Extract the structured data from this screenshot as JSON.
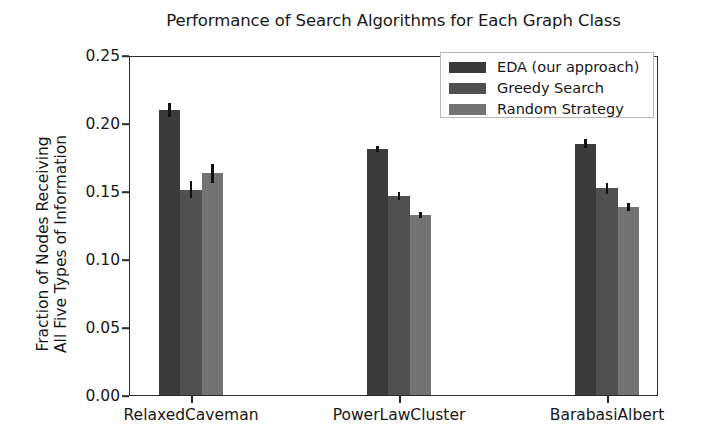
{
  "chart_data": {
    "type": "bar",
    "title": "Performance of Search Algorithms for Each Graph Class",
    "xlabel": "",
    "ylabel": "Fraction of Nodes Receiving All Five Types of Information",
    "ylabel_line1": "Fraction of Nodes Receiving",
    "ylabel_line2": "All Five Types of Information",
    "categories": [
      "RelaxedCaveman",
      "PowerLawCluster",
      "BarabasiAlbert"
    ],
    "ylim": [
      0.0,
      0.25
    ],
    "yticks": [
      "0.00",
      "0.05",
      "0.10",
      "0.15",
      "0.20",
      "0.25"
    ],
    "ytick_values": [
      0.0,
      0.05,
      0.1,
      0.15,
      0.2,
      0.25
    ],
    "grid": false,
    "legend_position": "upper right",
    "series": [
      {
        "name": "EDA (our approach)",
        "color": "#3b3b3b",
        "values": [
          0.211,
          0.182,
          0.186
        ],
        "errors": [
          0.005,
          0.002,
          0.003
        ]
      },
      {
        "name": "Greedy Search",
        "color": "#505050",
        "values": [
          0.152,
          0.147,
          0.153
        ],
        "errors": [
          0.006,
          0.003,
          0.004
        ]
      },
      {
        "name": "Random Strategy",
        "color": "#737373",
        "values": [
          0.164,
          0.133,
          0.139
        ],
        "errors": [
          0.007,
          0.002,
          0.003
        ]
      }
    ]
  },
  "axis": {
    "ytick_labels": [
      "0.25",
      "0.20",
      "0.15",
      "0.10",
      "0.05",
      "0.00"
    ],
    "xtick_labels": [
      "RelaxedCaveman",
      "PowerLawCluster",
      "BarabasiAlbert"
    ]
  },
  "legend": {
    "entries": [
      {
        "label": "EDA (our approach)",
        "color": "#3b3b3b"
      },
      {
        "label": "Greedy Search",
        "color": "#505050"
      },
      {
        "label": "Random Strategy",
        "color": "#737373"
      }
    ]
  },
  "colors": {
    "axis": "#2b2b2b",
    "text": "#171717",
    "background": "#ffffff",
    "error_bar": "#121212",
    "legend_border": "#b9b9b9"
  }
}
